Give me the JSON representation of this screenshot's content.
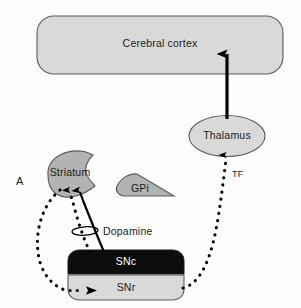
{
  "figure": {
    "panel_letter": "A",
    "background_color": "#fdfdfd"
  },
  "nodes": {
    "cortex": {
      "label": "Cerebral cortex",
      "shape": "rounded-rectangle",
      "fill": "#d9d9d9",
      "stroke": "#4d4d4d",
      "text_color": "#1a1a1a"
    },
    "thalamus": {
      "label": "Thalamus",
      "shape": "ellipse",
      "fill": "#d9d9d9",
      "stroke": "#4d4d4d",
      "text_color": "#1a1a1a"
    },
    "striatum": {
      "label": "Striatum",
      "shape": "comma-wedge",
      "fill": "#b3b3b3",
      "stroke": "#4d4d4d",
      "text_color": "#1a1a1a"
    },
    "gpi": {
      "label": "GPi",
      "shape": "triangle-wedge",
      "fill": "#b3b3b3",
      "stroke": "#4d4d4d",
      "text_color": "#1a1a1a"
    },
    "snc": {
      "label": "SNc",
      "shape": "rounded-rectangle-top",
      "fill": "#0d0d0d",
      "stroke": "#1a1a1a",
      "text_color": "#ffffff"
    },
    "snr": {
      "label": "SNr",
      "shape": "rounded-rectangle-bottom",
      "fill": "#d9d9d9",
      "stroke": "#4d4d4d",
      "text_color": "#1a1a1a"
    }
  },
  "annotations": {
    "dopamine": {
      "label": "Dopamine",
      "glyph": "ellipse-loop-icon"
    },
    "tf": {
      "label": "TF"
    }
  },
  "connections": [
    {
      "name": "thalamus-to-cortex",
      "from": "thalamus",
      "to": "cortex",
      "style": "solid",
      "arrow": "up",
      "color": "#000000"
    },
    {
      "name": "snr-to-thalamus",
      "from": "snr",
      "to": "thalamus",
      "style": "dotted",
      "arrow": "up",
      "color": "#000000",
      "label": "TF"
    },
    {
      "name": "snc-to-striatum-solid",
      "from": "snc",
      "to": "striatum",
      "style": "solid",
      "arrow": "up",
      "color": "#000000"
    },
    {
      "name": "snc-to-striatum-dotted",
      "from": "snc",
      "to": "striatum",
      "style": "dotted",
      "arrow": "up",
      "color": "#000000",
      "label": "Dopamine"
    },
    {
      "name": "striatum-to-snr",
      "from": "striatum",
      "to": "snr",
      "style": "dotted",
      "arrow": "right",
      "color": "#000000"
    }
  ]
}
